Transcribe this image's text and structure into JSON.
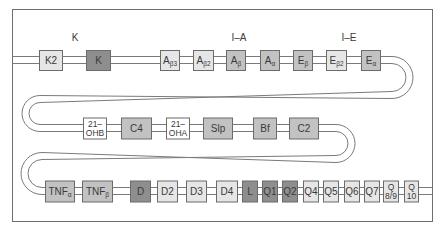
{
  "colors": {
    "frame": "#6e6e6e",
    "strand": "#7a7a7a",
    "box_border": "#6b6b6b",
    "text": "#3a3a3a",
    "fill_light": "#e6e6e6",
    "fill_medium": "#c2c2c2",
    "fill_dark": "#8e8e8e",
    "fill_white": "#ffffff"
  },
  "region_labels": [
    {
      "id": "K",
      "text": "K"
    },
    {
      "id": "I-A",
      "text": "I–A"
    },
    {
      "id": "I-E",
      "text": "I–E"
    }
  ],
  "rows": [
    {
      "name": "row-1",
      "genes": [
        {
          "main": "K2",
          "sub": "",
          "shade": "light"
        },
        {
          "main": "K",
          "sub": "",
          "shade": "dark"
        },
        {
          "main": "A",
          "sub": "β3",
          "shade": "light"
        },
        {
          "main": "A",
          "sub": "β2",
          "shade": "light"
        },
        {
          "main": "A",
          "sub": "β",
          "shade": "medium"
        },
        {
          "main": "A",
          "sub": "α",
          "shade": "medium"
        },
        {
          "main": "E",
          "sub": "β",
          "shade": "medium"
        },
        {
          "main": "E",
          "sub": "β2",
          "shade": "light"
        },
        {
          "main": "E",
          "sub": "α",
          "shade": "medium"
        }
      ]
    },
    {
      "name": "row-2",
      "genes": [
        {
          "line1": "21–",
          "line2": "OHB",
          "shade": "white"
        },
        {
          "main": "C4",
          "sub": "",
          "shade": "medium"
        },
        {
          "line1": "21–",
          "line2": "OHA",
          "shade": "white"
        },
        {
          "main": "Slp",
          "sub": "",
          "shade": "medium"
        },
        {
          "main": "Bf",
          "sub": "",
          "shade": "medium"
        },
        {
          "main": "C2",
          "sub": "",
          "shade": "medium"
        }
      ]
    },
    {
      "name": "row-3",
      "genes": [
        {
          "main": "TNF",
          "sub": "α",
          "shade": "medium"
        },
        {
          "main": "TNF",
          "sub": "β",
          "shade": "medium"
        },
        {
          "main": "D",
          "sub": "",
          "shade": "dark"
        },
        {
          "main": "D2",
          "sub": "",
          "shade": "light"
        },
        {
          "main": "D3",
          "sub": "",
          "shade": "light"
        },
        {
          "main": "D4",
          "sub": "",
          "shade": "light"
        },
        {
          "main": "L",
          "sub": "",
          "shade": "dark"
        },
        {
          "main": "Q1",
          "sub": "",
          "shade": "dark"
        },
        {
          "main": "Q2",
          "sub": "",
          "shade": "dark"
        },
        {
          "main": "Q4",
          "sub": "",
          "shade": "light"
        },
        {
          "main": "Q5",
          "sub": "",
          "shade": "light"
        },
        {
          "main": "Q6",
          "sub": "",
          "shade": "light"
        },
        {
          "main": "Q7",
          "sub": "",
          "shade": "light"
        },
        {
          "line1": "Q",
          "line2": "8/9",
          "shade": "light"
        },
        {
          "line1": "Q",
          "line2": "10",
          "shade": "light"
        }
      ]
    }
  ]
}
